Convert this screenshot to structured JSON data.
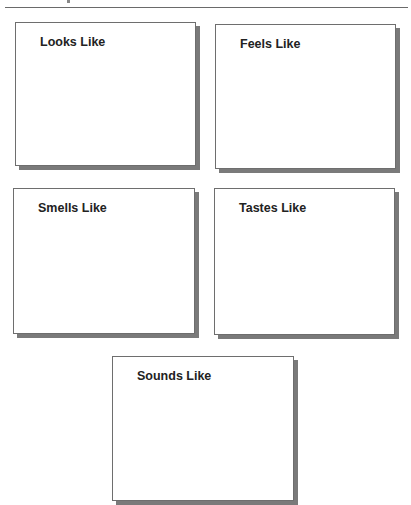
{
  "page": {
    "cards": [
      {
        "title": "Looks Like"
      },
      {
        "title": "Feels Like"
      },
      {
        "title": "Smells Like"
      },
      {
        "title": "Tastes Like"
      },
      {
        "title": "Sounds Like"
      }
    ]
  }
}
